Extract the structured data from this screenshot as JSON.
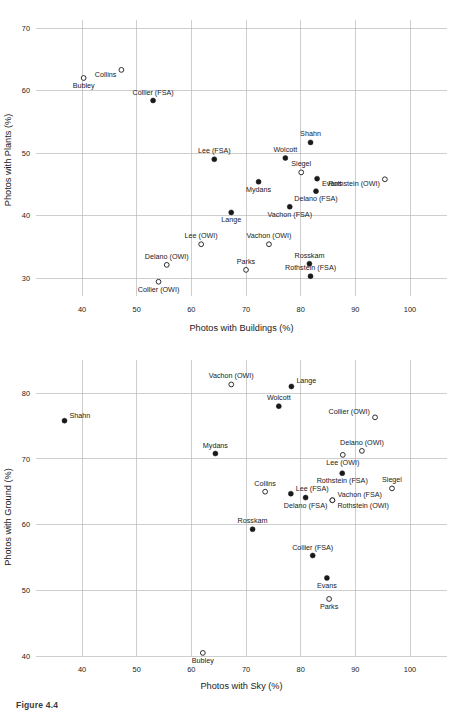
{
  "figure": {
    "caption": "Figure 4.4"
  },
  "chart_data": [
    {
      "id": "plants-vs-buildings",
      "type": "scatter",
      "title": "",
      "xlabel": "Photos with Buildings (%)",
      "ylabel": "Photos with Plants (%)",
      "xlim": [
        32,
        104
      ],
      "ylim": [
        27.5,
        72.5
      ],
      "xticks": [
        40,
        50,
        60,
        70,
        80,
        90,
        100
      ],
      "yticks": [
        30,
        40,
        50,
        60,
        70
      ],
      "grid": true,
      "legend": "none",
      "series": [
        {
          "name": "FSA",
          "marker": "filled-circle",
          "points": [
            {
              "label": "Collier (FSA)",
              "x": 53.0,
              "y": 58.4,
              "label_pos": "above"
            },
            {
              "label": "Shahn",
              "x": 81.8,
              "y": 51.7,
              "label_pos": "above"
            },
            {
              "label": "Lee (FSA)",
              "x": 64.2,
              "y": 49.0,
              "label_pos": "above"
            },
            {
              "label": "Wolcott",
              "x": 77.2,
              "y": 49.2,
              "label_pos": "above"
            },
            {
              "label": "Evans",
              "x": 83.0,
              "y": 45.9,
              "label_pos": "right-below"
            },
            {
              "label": "Mydans",
              "x": 72.3,
              "y": 45.4,
              "label_pos": "below"
            },
            {
              "label": "Delano (FSA)",
              "x": 82.8,
              "y": 43.9,
              "label_pos": "below"
            },
            {
              "label": "Vachon (FSA)",
              "x": 78.0,
              "y": 41.4,
              "label_pos": "below"
            },
            {
              "label": "Lange",
              "x": 67.3,
              "y": 40.5,
              "label_pos": "below"
            },
            {
              "label": "Rosskam",
              "x": 81.6,
              "y": 32.3,
              "label_pos": "above"
            },
            {
              "label": "Rothstein (FSA)",
              "x": 81.8,
              "y": 30.3,
              "label_pos": "above"
            }
          ]
        },
        {
          "name": "OWI",
          "marker": "open-circle",
          "points": [
            {
              "label": "Collins",
              "x": 47.2,
              "y": 63.3,
              "label_pos": "left-below"
            },
            {
              "label": "Bubley",
              "x": 40.3,
              "y": 62.0,
              "label_pos": "below"
            },
            {
              "label": "Siegel",
              "x": 80.1,
              "y": 46.9,
              "label_pos": "above"
            },
            {
              "label": "Rothstein (OWI)",
              "x": 95.4,
              "y": 45.8,
              "label_pos": "left-below"
            },
            {
              "label": "Lee (OWI)",
              "x": 61.8,
              "y": 35.4,
              "label_pos": "above"
            },
            {
              "label": "Vachon (OWI)",
              "x": 74.2,
              "y": 35.4,
              "label_pos": "above"
            },
            {
              "label": "Delano (OWI)",
              "x": 55.5,
              "y": 32.1,
              "label_pos": "above"
            },
            {
              "label": "Parks",
              "x": 70.0,
              "y": 31.3,
              "label_pos": "above"
            },
            {
              "label": "Collier (OWI)",
              "x": 54.0,
              "y": 29.4,
              "label_pos": "below"
            }
          ]
        }
      ]
    },
    {
      "id": "ground-vs-sky",
      "type": "scatter",
      "title": "",
      "xlabel": "Photos with Sky (%)",
      "ylabel": "Photos with Ground (%)",
      "xlim": [
        32,
        104
      ],
      "ylim": [
        37.5,
        84
      ],
      "xticks": [
        40,
        50,
        60,
        70,
        80,
        90,
        100
      ],
      "yticks": [
        40,
        50,
        60,
        70,
        80
      ],
      "grid": true,
      "legend": "none",
      "series": [
        {
          "name": "FSA",
          "marker": "filled-circle",
          "points": [
            {
              "label": "Lange",
              "x": 78.3,
              "y": 81.0,
              "label_pos": "above-right"
            },
            {
              "label": "Wolcott",
              "x": 76.0,
              "y": 78.0,
              "label_pos": "above"
            },
            {
              "label": "Shahn",
              "x": 36.8,
              "y": 75.8,
              "label_pos": "above-right"
            },
            {
              "label": "Mydans",
              "x": 64.4,
              "y": 70.8,
              "label_pos": "above"
            },
            {
              "label": "Rothstein (FSA)",
              "x": 87.6,
              "y": 67.8,
              "label_pos": "below"
            },
            {
              "label": "Lee (FSA)",
              "x": 78.2,
              "y": 64.7,
              "label_pos": "above-right"
            },
            {
              "label": "Delano (FSA)",
              "x": 80.9,
              "y": 64.1,
              "label_pos": "below"
            },
            {
              "label": "Rosskam",
              "x": 71.2,
              "y": 59.3,
              "label_pos": "above"
            },
            {
              "label": "Collier (FSA)",
              "x": 82.2,
              "y": 55.3,
              "label_pos": "above"
            },
            {
              "label": "Evans",
              "x": 84.8,
              "y": 51.9,
              "label_pos": "below"
            }
          ]
        },
        {
          "name": "OWI",
          "marker": "open-circle",
          "points": [
            {
              "label": "Vachon (OWI)",
              "x": 67.3,
              "y": 81.3,
              "label_pos": "above"
            },
            {
              "label": "Collier (OWI)",
              "x": 93.6,
              "y": 76.3,
              "label_pos": "above-left"
            },
            {
              "label": "Delano (OWI)",
              "x": 91.2,
              "y": 71.2,
              "label_pos": "above"
            },
            {
              "label": "Lee (OWI)",
              "x": 87.7,
              "y": 70.6,
              "label_pos": "below"
            },
            {
              "label": "Siegel",
              "x": 96.7,
              "y": 65.5,
              "label_pos": "above"
            },
            {
              "label": "Collins",
              "x": 73.5,
              "y": 65.0,
              "label_pos": "above"
            },
            {
              "label": "Vachon (FSA)",
              "x": 85.8,
              "y": 63.7,
              "label_pos": "above-right"
            },
            {
              "label": "Rothstein (OWI)",
              "x": 85.8,
              "y": 63.7,
              "label_pos": "below-right"
            },
            {
              "label": "Parks",
              "x": 85.2,
              "y": 48.7,
              "label_pos": "below"
            },
            {
              "label": "Bubley",
              "x": 62.1,
              "y": 40.5,
              "label_pos": "below"
            }
          ]
        }
      ]
    }
  ]
}
